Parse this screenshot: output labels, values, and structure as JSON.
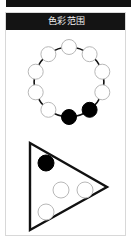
{
  "window": {
    "title": "色彩范围",
    "titlebar_bg": "#141414",
    "titlebar_text_color": "#f2f2f2",
    "panel_bg": "#ffffff",
    "panel_border": "#d8d8d8"
  },
  "diagram": {
    "stroke_color": "#111111",
    "node_fill_empty": "#ffffff",
    "node_fill_selected": "#000000",
    "node_stroke_empty": "#b8b8b8",
    "node_stroke_selected": "#000000",
    "ring": {
      "name": "color-ring",
      "node_count": 10,
      "selected_count": 2,
      "unselected_count": 8,
      "center_x": 63,
      "center_y": 52,
      "radius": 35,
      "node_radius": 7.5,
      "nodes": [
        {
          "id": "ring-node-1",
          "x": 63,
          "y": 17,
          "state": "empty"
        },
        {
          "id": "ring-node-2",
          "x": 83.6,
          "y": 24.2,
          "state": "empty"
        },
        {
          "id": "ring-node-3",
          "x": 96.3,
          "y": 41.7,
          "state": "empty"
        },
        {
          "id": "ring-node-4",
          "x": 96.3,
          "y": 62.3,
          "state": "empty"
        },
        {
          "id": "ring-node-5",
          "x": 83.6,
          "y": 79.8,
          "state": "selected"
        },
        {
          "id": "ring-node-6",
          "x": 63,
          "y": 87,
          "state": "selected"
        },
        {
          "id": "ring-node-7",
          "x": 42.4,
          "y": 79.8,
          "state": "empty"
        },
        {
          "id": "ring-node-8",
          "x": 29.7,
          "y": 62.3,
          "state": "empty"
        },
        {
          "id": "ring-node-9",
          "x": 29.7,
          "y": 41.7,
          "state": "empty"
        },
        {
          "id": "ring-node-10",
          "x": 42.4,
          "y": 24.2,
          "state": "empty"
        }
      ]
    },
    "triangle": {
      "name": "color-triangle",
      "direction": "right",
      "points": "24,113 24,200 101,157",
      "node_count": 4,
      "selected_count": 1,
      "unselected_count": 3,
      "node_radius": 8,
      "nodes": [
        {
          "id": "tri-node-1",
          "x": 40,
          "y": 133,
          "state": "selected"
        },
        {
          "id": "tri-node-2",
          "x": 55,
          "y": 160,
          "state": "empty"
        },
        {
          "id": "tri-node-3",
          "x": 79,
          "y": 160,
          "state": "empty"
        },
        {
          "id": "tri-node-4",
          "x": 40,
          "y": 182,
          "state": "empty"
        }
      ]
    }
  }
}
